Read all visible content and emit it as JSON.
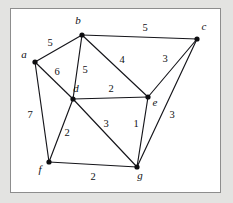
{
  "diagram": {
    "colors": {
      "background": "#e3e3e1",
      "panel": "#ffffff",
      "border": "#8d8d8d",
      "edge": "#15151a",
      "vertex": "#0d0d10",
      "text": "#101014"
    },
    "vertices": [
      {
        "id": "a",
        "label": "a",
        "x": 35,
        "y": 62,
        "label_x": 24,
        "label_y": 58
      },
      {
        "id": "b",
        "label": "b",
        "x": 82,
        "y": 35,
        "label_x": 78,
        "label_y": 24
      },
      {
        "id": "c",
        "label": "c",
        "x": 197,
        "y": 39,
        "label_x": 204,
        "label_y": 30
      },
      {
        "id": "d",
        "label": "d",
        "x": 73,
        "y": 99,
        "label_x": 76,
        "label_y": 92
      },
      {
        "id": "e",
        "label": "e",
        "x": 148,
        "y": 97,
        "label_x": 155,
        "label_y": 106
      },
      {
        "id": "f",
        "label": "f",
        "x": 49,
        "y": 162,
        "label_x": 40,
        "label_y": 173
      },
      {
        "id": "g",
        "label": "g",
        "x": 137,
        "y": 167,
        "label_x": 140,
        "label_y": 179
      }
    ],
    "edges": [
      {
        "from": "a",
        "to": "b",
        "weight": "5",
        "label_x": 50,
        "label_y": 46
      },
      {
        "from": "a",
        "to": "d",
        "weight": "6",
        "label_x": 57,
        "label_y": 75
      },
      {
        "from": "a",
        "to": "f",
        "weight": "7",
        "label_x": 30,
        "label_y": 118
      },
      {
        "from": "b",
        "to": "c",
        "weight": "5",
        "label_x": 145,
        "label_y": 31
      },
      {
        "from": "b",
        "to": "d",
        "weight": "5",
        "label_x": 85,
        "label_y": 73
      },
      {
        "from": "b",
        "to": "e",
        "weight": "4",
        "label_x": 122,
        "label_y": 63
      },
      {
        "from": "c",
        "to": "e",
        "weight": "3",
        "label_x": 165,
        "label_y": 62
      },
      {
        "from": "c",
        "to": "g",
        "weight": "3",
        "label_x": 172,
        "label_y": 118
      },
      {
        "from": "d",
        "to": "e",
        "weight": "2",
        "label_x": 111,
        "label_y": 92
      },
      {
        "from": "d",
        "to": "f",
        "weight": "2",
        "label_x": 67,
        "label_y": 136
      },
      {
        "from": "d",
        "to": "g",
        "weight": "3",
        "label_x": 106,
        "label_y": 127
      },
      {
        "from": "e",
        "to": "g",
        "weight": "1",
        "label_x": 136,
        "label_y": 127
      },
      {
        "from": "f",
        "to": "g",
        "weight": "2",
        "label_x": 93,
        "label_y": 180
      }
    ]
  }
}
